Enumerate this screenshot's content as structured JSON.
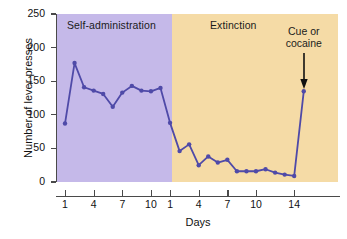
{
  "chart_data": {
    "type": "line",
    "title": "",
    "xlabel": "Days",
    "ylabel": "Number of lever presses",
    "ylim": [
      0,
      250
    ],
    "ytick_values": [
      0,
      50,
      100,
      150,
      200,
      250
    ],
    "ytick_labels": [
      "0",
      "50",
      "100",
      "150",
      "200",
      "250"
    ],
    "grid": false,
    "legend": "none",
    "line_color": "#4f4aa8",
    "marker_color": "#4f4aa8",
    "phases": [
      {
        "name": "Self-administration",
        "band_color": "#c5b9e9",
        "xtick_labels": [
          "1",
          "4",
          "7",
          "10"
        ],
        "xtick_days": [
          1,
          4,
          7,
          10
        ],
        "days": [
          1,
          2,
          3,
          4,
          5,
          6,
          7,
          8,
          9,
          10,
          11
        ],
        "values": [
          87,
          177,
          141,
          136,
          131,
          112,
          133,
          143,
          136,
          135,
          140
        ]
      },
      {
        "name": "Extinction",
        "band_color": "#f5dba6",
        "xtick_labels": [
          "1",
          "4",
          "7",
          "10",
          "14"
        ],
        "xtick_days": [
          1,
          4,
          7,
          10,
          14
        ],
        "days": [
          1,
          2,
          3,
          4,
          5,
          6,
          7,
          8,
          9,
          10,
          11,
          12,
          13,
          14,
          15
        ],
        "values": [
          88,
          46,
          56,
          25,
          38,
          29,
          33,
          16,
          16,
          16,
          19,
          14,
          11,
          9,
          135
        ]
      }
    ],
    "annotations": [
      {
        "text_line_1": "Cue or",
        "text_line_2": "cocaine",
        "points_to_day": 15,
        "points_to_value": 135,
        "marker": "down-arrow"
      }
    ]
  }
}
